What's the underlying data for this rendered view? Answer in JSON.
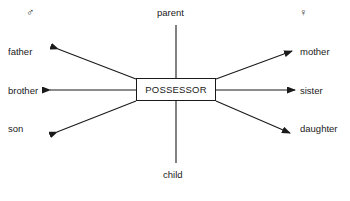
{
  "diagram": {
    "title_node": "POSSESSOR",
    "gender_symbols": {
      "male": "♂",
      "female": "♀"
    },
    "vertical_relations": {
      "top": "parent",
      "bottom": "child"
    },
    "male_relations": [
      "father",
      "brother",
      "son"
    ],
    "female_relations": [
      "mother",
      "sister",
      "daughter"
    ],
    "colors": {
      "stroke": "#1a1a1a",
      "background": "#ffffff",
      "text": "#1a1a1a"
    }
  }
}
